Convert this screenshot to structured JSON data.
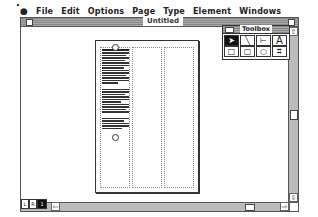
{
  "menubar": {
    "apple_icon": "",
    "items": [
      "File",
      "Edit",
      "Options",
      "Page",
      "Type",
      "Element",
      "Windows"
    ]
  },
  "document_window": {
    "title": "Untitled"
  },
  "toolbox": {
    "title": "Toolbox",
    "tools": [
      {
        "name": "pointer-tool",
        "glyph": "➤",
        "selected": true
      },
      {
        "name": "diagonal-line-tool",
        "glyph": "╲",
        "selected": false
      },
      {
        "name": "orthogonal-line-tool",
        "glyph": "⊢",
        "selected": false
      },
      {
        "name": "text-tool",
        "glyph": "A",
        "selected": false
      },
      {
        "name": "rectangle-tool",
        "glyph": "□",
        "selected": false
      },
      {
        "name": "rounded-rectangle-tool",
        "glyph": "▢",
        "selected": false
      },
      {
        "name": "oval-tool",
        "glyph": "○",
        "selected": false
      },
      {
        "name": "crop-tool",
        "glyph": "⌗",
        "selected": false
      }
    ]
  },
  "page_icons": {
    "left": "L",
    "right": "R",
    "current": "1"
  },
  "scroll_arrows": {
    "up": "⇧",
    "down": "⇩",
    "left": "⇦",
    "right": "⇨"
  }
}
